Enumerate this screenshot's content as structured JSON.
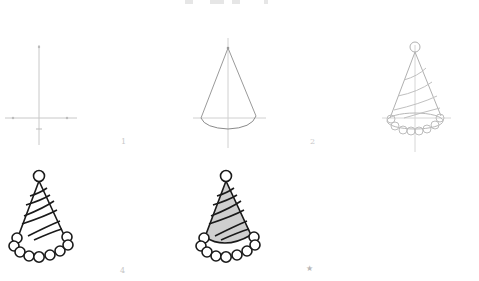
{
  "steps": [
    {
      "label": "1",
      "description": "Guide lines: vertical axis and horizontal base line"
    },
    {
      "label": "2",
      "description": "Cone outline with curved base"
    },
    {
      "label": "3",
      "description": "Light sketch with pom-pom, stripes and trim"
    },
    {
      "label": "4",
      "description": "Inked outline"
    },
    {
      "label": "",
      "description": "Colored final drawing"
    }
  ],
  "final_marker": {
    "icon": "star-icon",
    "glyph": "★"
  },
  "colors": {
    "guide": "#c8c8c8",
    "sketch": "#b0b0b0",
    "ink": "#1a1a1a",
    "fill": "#cfcfcf",
    "label": "#c8c8c8"
  }
}
